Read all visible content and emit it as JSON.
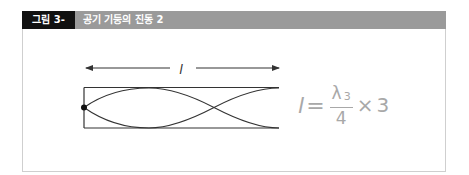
{
  "figure": {
    "label": "그림 3-15",
    "title": "공기 기둥의 진동 2",
    "colors": {
      "label_bg": "#111111",
      "title_bar_bg": "#9a9a9a",
      "line": "#333333",
      "formula": "#a8a8a8"
    }
  },
  "diagram": {
    "length_label": "l",
    "tube": {
      "closed_end": "left",
      "open_end": "right",
      "harmonic": 3
    },
    "wave": {
      "nodes_x_fraction": [
        0,
        0.6667
      ],
      "antinodes_x_fraction": [
        0.3333,
        1.0
      ]
    }
  },
  "formula": {
    "lhs": "l",
    "equals": "=",
    "numerator": "λ",
    "numerator_subscript": "3",
    "denominator": "4",
    "times": "×",
    "multiplier": "3"
  }
}
